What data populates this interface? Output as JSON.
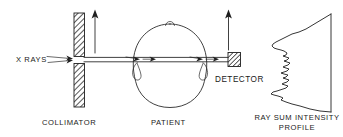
{
  "figure": {
    "background_color": "#ffffff",
    "ink_color": "#1f1f1f",
    "width": 343,
    "height": 137
  },
  "labels": {
    "xrays": "X RAYS",
    "detector": "DETECTOR",
    "collimator": "COLLIMATOR",
    "patient": "PATIENT",
    "profile_line1": "RAY SUM INTENSITY",
    "profile_line2": "PROFILE"
  },
  "chart_data": {
    "type": "line",
    "title": "RAY SUM INTENSITY PROFILE",
    "xlabel": "",
    "ylabel": "",
    "orientation": "vertical-baseline-right",
    "baseline_x": 331,
    "baseline_y_range": [
      14,
      112
    ],
    "grid": false,
    "legend": null,
    "points": [
      [
        331,
        14
      ],
      [
        306,
        29
      ],
      [
        299,
        32
      ],
      [
        292,
        34
      ],
      [
        286,
        37
      ],
      [
        280,
        40
      ],
      [
        276,
        42
      ],
      [
        273,
        44
      ],
      [
        272,
        46
      ],
      [
        274,
        48
      ],
      [
        277,
        49
      ],
      [
        281,
        50
      ],
      [
        284,
        51
      ],
      [
        287,
        53
      ],
      [
        286,
        55
      ],
      [
        283,
        56
      ],
      [
        286,
        57
      ],
      [
        289,
        58
      ],
      [
        287,
        60
      ],
      [
        284,
        61
      ],
      [
        287,
        62
      ],
      [
        290,
        63
      ],
      [
        288,
        65
      ],
      [
        285,
        66
      ],
      [
        283,
        67
      ],
      [
        286,
        68
      ],
      [
        289,
        69
      ],
      [
        287,
        71
      ],
      [
        284,
        72
      ],
      [
        281,
        73
      ],
      [
        284,
        74
      ],
      [
        288,
        75
      ],
      [
        286,
        77
      ],
      [
        283,
        78
      ],
      [
        286,
        79
      ],
      [
        289,
        80
      ],
      [
        287,
        82
      ],
      [
        284,
        83
      ],
      [
        282,
        84
      ],
      [
        285,
        85
      ],
      [
        288,
        86
      ],
      [
        286,
        88
      ],
      [
        283,
        89
      ],
      [
        280,
        90
      ],
      [
        277,
        91
      ],
      [
        273,
        92
      ],
      [
        271,
        94
      ],
      [
        274,
        95
      ],
      [
        278,
        96
      ],
      [
        281,
        97
      ],
      [
        283,
        98
      ],
      [
        281,
        100
      ],
      [
        286,
        102
      ],
      [
        292,
        104
      ],
      [
        300,
        106
      ],
      [
        310,
        109
      ],
      [
        320,
        111
      ],
      [
        331,
        112
      ]
    ]
  },
  "elements": {
    "collimator": {
      "name": "collimator",
      "fill": "hatched",
      "upper_block": {
        "x": 74,
        "y": 13,
        "w": 10,
        "h": 43
      },
      "lower_block": {
        "x": 74,
        "y": 64,
        "w": 10,
        "h": 43
      },
      "aperture_gap": {
        "y": 56,
        "h": 8
      }
    },
    "detector": {
      "name": "detector",
      "fill": "hatched",
      "block": {
        "x": 228,
        "y": 53,
        "w": 12,
        "h": 13
      }
    },
    "patient_head": {
      "name": "patient-head-outline",
      "center": [
        170,
        63
      ],
      "nose_bump": [
        170,
        20
      ],
      "ear_left": [
        138,
        70
      ],
      "ear_right": [
        201,
        70
      ]
    },
    "beam": {
      "name": "x-ray-beam",
      "y_top": 57,
      "y_bottom": 62,
      "x_start": 84,
      "x_end": 229
    },
    "motion_arrows": [
      {
        "name": "collimator-motion-arrow",
        "x": 95,
        "y_from": 53,
        "y_to": 11
      },
      {
        "name": "detector-motion-arrow",
        "x": 228,
        "y_from": 50,
        "y_to": 11
      }
    ]
  }
}
